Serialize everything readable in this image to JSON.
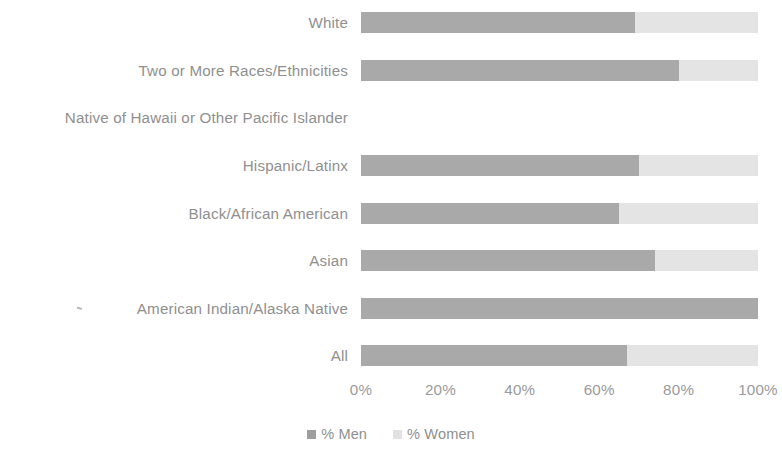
{
  "chart_data": {
    "type": "bar",
    "orientation": "horizontal",
    "stacked": true,
    "stack_total": 100,
    "title": "",
    "xlabel": "",
    "ylabel": "",
    "xlim": [
      0,
      100
    ],
    "grid": false,
    "legend_position": "bottom",
    "categories": [
      "White",
      "Two or More Races/Ethnicities",
      "Native of Hawaii or Other Pacific Islander",
      "Hispanic/Latinx",
      "Black/African American",
      "Asian",
      "American Indian/Alaska Native",
      "All"
    ],
    "tick_labels": [
      "0%",
      "20%",
      "40%",
      "60%",
      "80%",
      "100%"
    ],
    "tick_values": [
      0,
      20,
      40,
      60,
      80,
      100
    ],
    "series": [
      {
        "name": "% Men",
        "color": "#a9a9a9",
        "values": [
          69,
          80,
          null,
          70,
          65,
          74,
          100,
          67
        ]
      },
      {
        "name": "% Women",
        "color": "#e4e4e4",
        "values": [
          31,
          20,
          null,
          30,
          35,
          26,
          0,
          33
        ]
      }
    ],
    "rows": [
      {
        "label": "White",
        "men": 69,
        "women": 31,
        "has_data": true
      },
      {
        "label": "Two or More Races/Ethnicities",
        "men": 80,
        "women": 20,
        "has_data": true
      },
      {
        "label": "Native of Hawaii or Other Pacific Islander",
        "men": null,
        "women": null,
        "has_data": false
      },
      {
        "label": "Hispanic/Latinx",
        "men": 70,
        "women": 30,
        "has_data": true
      },
      {
        "label": "Black/African American",
        "men": 65,
        "women": 35,
        "has_data": true
      },
      {
        "label": "Asian",
        "men": 74,
        "women": 26,
        "has_data": true
      },
      {
        "label": "American Indian/Alaska Native",
        "men": 100,
        "women": 0,
        "has_data": true
      },
      {
        "label": "All",
        "men": 67,
        "women": 33,
        "has_data": true
      }
    ]
  },
  "legend": {
    "men_label": "% Men",
    "women_label": "% Women"
  },
  "colors": {
    "men": "#a9a9a9",
    "women": "#e4e4e4",
    "text": "#8f8f8f",
    "background": "#ffffff"
  }
}
